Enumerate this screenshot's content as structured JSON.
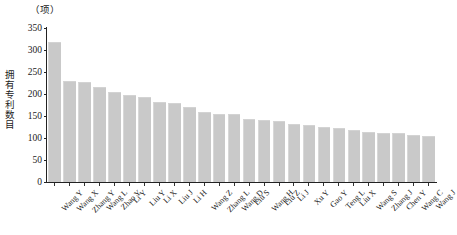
{
  "chart_data": {
    "type": "bar",
    "title": "",
    "unit_label": "（项）",
    "ylabel": "拥有专利数目",
    "xlabel": "",
    "ylim": [
      0,
      350
    ],
    "yticks": [
      0,
      50,
      100,
      150,
      200,
      250,
      300,
      350
    ],
    "grid": false,
    "legend": null,
    "bar_color": "#c9c9c9",
    "axis_color": "#222222",
    "categories": [
      "Wang Y",
      "Wang X",
      "Zhang Y",
      "Wang L",
      "Zhao Y",
      "Li Y",
      "Liu Y",
      "Li X",
      "Liu J",
      "Li H",
      "Wang Z",
      "Zhang L",
      "Wang D",
      "Liu S",
      "Wang H",
      "Liu Z",
      "Li J",
      "Xu Y",
      "Gao Y",
      "Teng L",
      "Liu X",
      "Wang S",
      "Zhang J",
      "Chen Y",
      "Wang C",
      "Wang J"
    ],
    "values": [
      315,
      227,
      226,
      214,
      202,
      196,
      190,
      180,
      178,
      168,
      157,
      152,
      152,
      140,
      138,
      136,
      130,
      127,
      123,
      120,
      115,
      112,
      110,
      108,
      105,
      103
    ]
  }
}
